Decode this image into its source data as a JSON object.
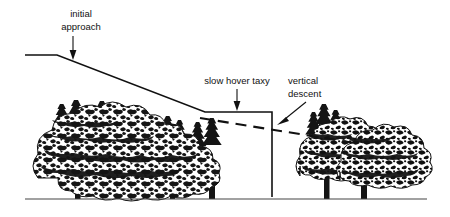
{
  "figure": {
    "background_color": "#ffffff",
    "ink_color": "#111111",
    "ground_color": "#444444",
    "width": 450,
    "height": 217
  },
  "labels": {
    "initial_approach": {
      "line1": "initial",
      "line2": "approach"
    },
    "slow_hover_taxy": {
      "line1": "slow hover taxy"
    },
    "vertical_descent": {
      "line1": "vertical",
      "line2": "descent"
    }
  },
  "geometry": {
    "flight_path": "M 25 55 L 57 55 L 205 112 L 272 112 L 272 197",
    "obstacle_clearance_dashed": "M 200 118 L 355 143",
    "ground": "M 25 199 L 427 199"
  },
  "scene": {
    "left_tree_group_label": "tall conifer-broadleaf tree line",
    "right_tree_group_label": "two broadleaf trees",
    "left_trunks_x": [
      78,
      118,
      140,
      172,
      212
    ],
    "right_trunks_x": [
      327,
      364
    ]
  }
}
